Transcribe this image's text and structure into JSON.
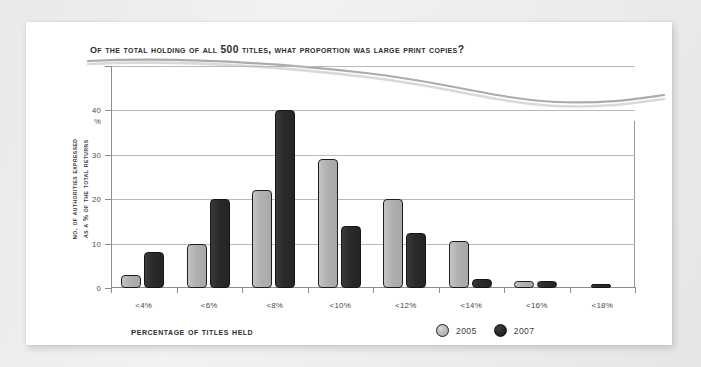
{
  "card": {
    "title": "Of the total holding of all 500 titles, what proportion was Large Print copies?"
  },
  "axes": {
    "y_caption_line1": "No. of authorities expressed",
    "y_caption_line2": "as a % of the total returns",
    "x_title": "Percentage of titles held",
    "y_unit_label": "%"
  },
  "legend": {
    "items": [
      {
        "label": "2005",
        "color": "#b0b0b0"
      },
      {
        "label": "2007",
        "color": "#2a2a2a"
      }
    ]
  },
  "chart_data": {
    "type": "bar",
    "title": "Of the total holding of all 500 titles, what proportion was Large Print copies?",
    "xlabel": "Percentage of titles held",
    "ylabel": "No. of authorities expressed as a % of the total returns",
    "categories": [
      "<4%",
      "<6%",
      "<8%",
      "<10%",
      "<12%",
      "<14%",
      "<16%",
      "<18%"
    ],
    "series": [
      {
        "name": "2005",
        "color": "#b0b0b0",
        "values": [
          3,
          10,
          22,
          29,
          20,
          10.5,
          1.5,
          0
        ]
      },
      {
        "name": "2007",
        "color": "#2a2a2a",
        "values": [
          8,
          20,
          40,
          14,
          12.5,
          2,
          1.5,
          1
        ]
      }
    ],
    "ylim": [
      0,
      50
    ],
    "yticks": [
      0,
      10,
      20,
      30,
      40,
      50
    ],
    "ytick_labels": [
      "0",
      "10",
      "20",
      "30",
      "40",
      ""
    ],
    "grid": true,
    "legend_position": "bottom-right"
  }
}
